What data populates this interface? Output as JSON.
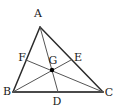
{
  "figure": {
    "background_color": "#ffffff",
    "stroke_color": "#2b2b2b",
    "base_stroke_color": "#4a4a4a",
    "median_stroke_color": "#555555",
    "point_color": "#000000",
    "label_color": "#1a1a1a",
    "width": 116,
    "height": 108
  },
  "points": {
    "A": {
      "label": "A",
      "x": 40,
      "y": 27,
      "label_x": 38,
      "label_y": 13
    },
    "B": {
      "label": "B",
      "x": 13,
      "y": 92,
      "label_x": 7,
      "label_y": 91
    },
    "C": {
      "label": "C",
      "x": 103,
      "y": 92,
      "label_x": 109,
      "label_y": 92
    },
    "D": {
      "label": "D",
      "x": 58,
      "y": 92,
      "label_x": 57,
      "label_y": 101
    },
    "E": {
      "label": "E",
      "x": 71,
      "y": 60,
      "label_x": 78,
      "label_y": 57
    },
    "F": {
      "label": "F",
      "x": 26,
      "y": 60,
      "label_x": 22,
      "label_y": 57
    },
    "G": {
      "label": "G",
      "x": 52,
      "y": 70,
      "label_x": 53,
      "label_y": 60
    }
  },
  "segments": [
    {
      "name": "side-AB",
      "from": "A",
      "to": "B",
      "width": 1.5
    },
    {
      "name": "side-AC",
      "from": "A",
      "to": "C",
      "width": 1.5
    },
    {
      "name": "side-BC",
      "from": "B",
      "to": "C",
      "width": 2
    },
    {
      "name": "median-AD",
      "from": "A",
      "to": "D",
      "width": 1
    },
    {
      "name": "median-BE",
      "from": "B",
      "to": "E",
      "width": 1
    },
    {
      "name": "median-CF",
      "from": "C",
      "to": "F",
      "width": 1
    }
  ],
  "centroid_marker": {
    "name": "centroid-point",
    "x": 52,
    "y": 70,
    "radius": 2.2
  }
}
